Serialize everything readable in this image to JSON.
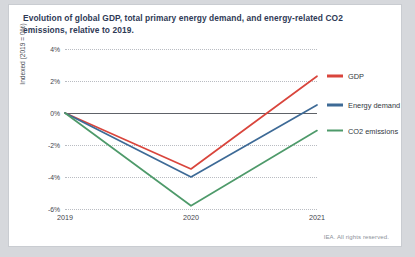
{
  "card": {
    "title": "Evolution of global GDP, total primary energy demand, and energy-related CO2 emissions, relative to 2019.",
    "footer": "IEA. All rights reserved."
  },
  "colors": {
    "gdp": "#d9453c",
    "energy": "#3d6a96",
    "co2": "#4e9a6a",
    "gridline": "#b9bcc2",
    "zeroline": "#5e6268",
    "title_text": "#2f3a56",
    "axis_text": "#3f444b",
    "card_background": "#ffffff",
    "page_background": "#d6d8dc"
  },
  "chart_data": {
    "type": "line",
    "title": "Evolution of global GDP, total primary energy demand, and energy-related CO2 emissions, relative to 2019.",
    "xlabel": "",
    "ylabel": "Indexed (2019 = 0%)",
    "categories": [
      "2019",
      "2020",
      "2021"
    ],
    "x": [
      2019,
      2020,
      2021
    ],
    "ylim": [
      -6,
      4
    ],
    "yticks": [
      4,
      2,
      0,
      -2,
      -4,
      -6
    ],
    "ytick_labels": [
      "4%",
      "2%",
      "0%",
      "-2%",
      "-4%",
      "-6%"
    ],
    "xtick_labels": [
      "2019",
      "2020",
      "2021"
    ],
    "grid": true,
    "grid_style": "dotted-horizontal",
    "zero_line": 0,
    "legend_position": "right-inline",
    "series": [
      {
        "name": "GDP",
        "color": "#d9453c",
        "values": [
          0,
          -3.5,
          2.3
        ]
      },
      {
        "name": "Energy demand",
        "color": "#3d6a96",
        "values": [
          0,
          -4.0,
          0.5
        ]
      },
      {
        "name": "CO2 emissions",
        "color": "#4e9a6a",
        "values": [
          0,
          -5.8,
          -1.1
        ]
      }
    ]
  },
  "legend": [
    {
      "label": "GDP",
      "color": "#d9453c"
    },
    {
      "label": "Energy demand",
      "color": "#3d6a96"
    },
    {
      "label": "CO2 emissions",
      "color": "#4e9a6a"
    }
  ]
}
